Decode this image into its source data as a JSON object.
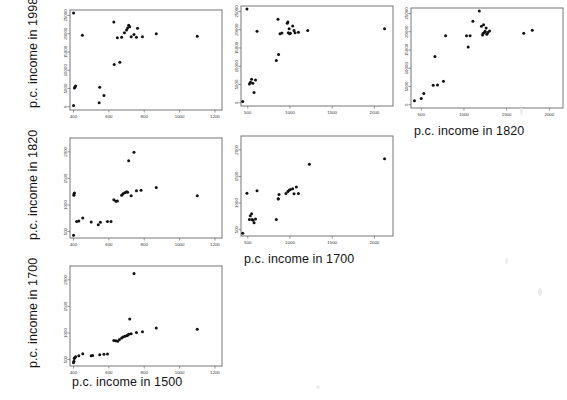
{
  "figure": {
    "type": "scatterplot-matrix",
    "background": "#ffffff",
    "point_color": "#111111",
    "frame_color": "#777777"
  },
  "axis_titles": {
    "y_1998": "p.c. income in 1998",
    "y_1820": "p.c. income in 1820",
    "y_1700": "p.c. income in 1700",
    "x_1500": "p.c. income in 1500",
    "x_1700": "p.c. income in 1700",
    "x_1820": "p.c. income in 1820"
  },
  "chart_data": [
    {
      "id": "panel-1998-vs-1500",
      "type": "scatter",
      "title": "",
      "xlabel": "p.c. income in 1500",
      "ylabel": "p.c. income in 1998",
      "xlim": [
        380,
        1240
      ],
      "ylim": [
        -900,
        26500
      ],
      "xticks": [
        400,
        600,
        800,
        1000,
        1200
      ],
      "yticks": [
        0,
        5000,
        10000,
        15000,
        20000,
        25000
      ],
      "grid": false,
      "points": [
        [
          400,
          25700
        ],
        [
          400,
          300
        ],
        [
          405,
          5100
        ],
        [
          408,
          5400
        ],
        [
          412,
          5700
        ],
        [
          450,
          19600
        ],
        [
          545,
          1100
        ],
        [
          548,
          5300
        ],
        [
          572,
          3100
        ],
        [
          628,
          23200
        ],
        [
          630,
          11600
        ],
        [
          648,
          18900
        ],
        [
          662,
          12200
        ],
        [
          672,
          19000
        ],
        [
          688,
          20300
        ],
        [
          700,
          21000
        ],
        [
          706,
          21600
        ],
        [
          712,
          22300
        ],
        [
          718,
          21900
        ],
        [
          726,
          19200
        ],
        [
          742,
          19800
        ],
        [
          756,
          19000
        ],
        [
          762,
          21500
        ],
        [
          790,
          19200
        ],
        [
          868,
          20000
        ],
        [
          1100,
          19300
        ]
      ]
    },
    {
      "id": "panel-1998-vs-1700",
      "type": "scatter",
      "title": "",
      "xlabel": "p.c. income in 1700",
      "ylabel": "p.c. income in 1998",
      "xlim": [
        420,
        2220
      ],
      "ylim": [
        -900,
        26500
      ],
      "xticks": [
        500,
        1000,
        1500,
        2000
      ],
      "yticks": [
        0,
        5000,
        10000,
        15000,
        20000,
        25000
      ],
      "grid": false,
      "points": [
        [
          440,
          300
        ],
        [
          490,
          25700
        ],
        [
          520,
          5100
        ],
        [
          532,
          5600
        ],
        [
          545,
          6400
        ],
        [
          560,
          5300
        ],
        [
          575,
          2800
        ],
        [
          592,
          6200
        ],
        [
          610,
          19600
        ],
        [
          838,
          11600
        ],
        [
          858,
          22900
        ],
        [
          865,
          13200
        ],
        [
          882,
          18900
        ],
        [
          905,
          19100
        ],
        [
          968,
          21800
        ],
        [
          975,
          22100
        ],
        [
          980,
          19200
        ],
        [
          990,
          20300
        ],
        [
          996,
          18900
        ],
        [
          1005,
          19000
        ],
        [
          1032,
          21000
        ],
        [
          1048,
          19800
        ],
        [
          1060,
          19200
        ],
        [
          1100,
          19300
        ],
        [
          1210,
          19800
        ],
        [
          2120,
          20300
        ]
      ]
    },
    {
      "id": "panel-1998-vs-1820",
      "type": "scatter",
      "title": "",
      "xlabel": "p.c. income in 1820",
      "ylabel": "p.c. income in 1998",
      "xlim": [
        380,
        2160
      ],
      "ylim": [
        -900,
        26500
      ],
      "xticks": [
        500,
        1000,
        1500,
        2000
      ],
      "yticks": [
        0,
        5000,
        10000,
        15000,
        20000,
        25000
      ],
      "grid": false,
      "points": [
        [
          420,
          1100
        ],
        [
          500,
          1700
        ],
        [
          530,
          3100
        ],
        [
          640,
          5300
        ],
        [
          660,
          13200
        ],
        [
          690,
          5400
        ],
        [
          760,
          6400
        ],
        [
          785,
          18900
        ],
        [
          1030,
          18900
        ],
        [
          1050,
          15800
        ],
        [
          1072,
          18900
        ],
        [
          1105,
          22900
        ],
        [
          1180,
          25700
        ],
        [
          1205,
          21500
        ],
        [
          1218,
          19100
        ],
        [
          1225,
          19600
        ],
        [
          1230,
          21900
        ],
        [
          1240,
          19800
        ],
        [
          1248,
          20100
        ],
        [
          1260,
          21000
        ],
        [
          1268,
          19300
        ],
        [
          1280,
          19800
        ],
        [
          1300,
          20200
        ],
        [
          1700,
          19600
        ],
        [
          1800,
          20400
        ]
      ]
    },
    {
      "id": "panel-1820-vs-1500",
      "type": "scatter",
      "title": "",
      "xlabel": "p.c. income in 1500",
      "ylabel": "p.c. income in 1820",
      "xlim": [
        380,
        1240
      ],
      "ylim": [
        380,
        2260
      ],
      "xticks": [
        400,
        600,
        800,
        1000,
        1200
      ],
      "yticks": [
        500,
        1000,
        1500,
        2000
      ],
      "grid": false,
      "points": [
        [
          400,
          430
        ],
        [
          402,
          1185
        ],
        [
          402,
          1205
        ],
        [
          405,
          1225
        ],
        [
          418,
          690
        ],
        [
          430,
          700
        ],
        [
          452,
          755
        ],
        [
          500,
          680
        ],
        [
          540,
          630
        ],
        [
          552,
          675
        ],
        [
          592,
          690
        ],
        [
          612,
          690
        ],
        [
          628,
          1100
        ],
        [
          640,
          1070
        ],
        [
          648,
          1075
        ],
        [
          672,
          1185
        ],
        [
          680,
          1210
        ],
        [
          690,
          1230
        ],
        [
          700,
          1250
        ],
        [
          706,
          1240
        ],
        [
          712,
          1830
        ],
        [
          726,
          1175
        ],
        [
          742,
          1990
        ],
        [
          756,
          1270
        ],
        [
          782,
          1280
        ],
        [
          868,
          1330
        ],
        [
          1100,
          1175
        ]
      ]
    },
    {
      "id": "panel-1820-vs-1700",
      "type": "scatter",
      "title": "",
      "xlabel": "p.c. income in 1700",
      "ylabel": "p.c. income in 1820",
      "xlim": [
        420,
        2220
      ],
      "ylim": [
        380,
        2260
      ],
      "xticks": [
        500,
        1000,
        1500,
        2000
      ],
      "yticks": [
        500,
        1000,
        1500,
        2000
      ],
      "grid": false,
      "points": [
        [
          440,
          430
        ],
        [
          490,
          1185
        ],
        [
          520,
          690
        ],
        [
          530,
          760
        ],
        [
          545,
          800
        ],
        [
          552,
          690
        ],
        [
          562,
          675
        ],
        [
          575,
          630
        ],
        [
          592,
          700
        ],
        [
          610,
          1230
        ],
        [
          838,
          690
        ],
        [
          860,
          1080
        ],
        [
          862,
          1075
        ],
        [
          870,
          1160
        ],
        [
          952,
          1180
        ],
        [
          975,
          1215
        ],
        [
          990,
          1240
        ],
        [
          1005,
          1255
        ],
        [
          1032,
          1270
        ],
        [
          1048,
          1175
        ],
        [
          1075,
          1300
        ],
        [
          1100,
          1180
        ],
        [
          1230,
          1730
        ],
        [
          2120,
          1830
        ]
      ]
    },
    {
      "id": "panel-1700-vs-1500",
      "type": "scatter",
      "title": "",
      "xlabel": "p.c. income in 1500",
      "ylabel": "p.c. income in 1700",
      "xlim": [
        380,
        1240
      ],
      "ylim": [
        380,
        2260
      ],
      "xticks": [
        400,
        600,
        800,
        1000,
        1200
      ],
      "yticks": [
        500,
        1000,
        1500,
        2000
      ],
      "grid": false,
      "points": [
        [
          400,
          440
        ],
        [
          402,
          470
        ],
        [
          404,
          520
        ],
        [
          408,
          540
        ],
        [
          412,
          555
        ],
        [
          430,
          575
        ],
        [
          452,
          610
        ],
        [
          500,
          575
        ],
        [
          508,
          578
        ],
        [
          548,
          590
        ],
        [
          572,
          600
        ],
        [
          592,
          605
        ],
        [
          628,
          860
        ],
        [
          640,
          855
        ],
        [
          650,
          845
        ],
        [
          660,
          880
        ],
        [
          672,
          905
        ],
        [
          680,
          925
        ],
        [
          690,
          940
        ],
        [
          700,
          950
        ],
        [
          706,
          960
        ],
        [
          712,
          975
        ],
        [
          718,
          1265
        ],
        [
          726,
          985
        ],
        [
          742,
          2120
        ],
        [
          756,
          1010
        ],
        [
          790,
          1025
        ],
        [
          868,
          1095
        ],
        [
          1100,
          1070
        ]
      ]
    }
  ]
}
